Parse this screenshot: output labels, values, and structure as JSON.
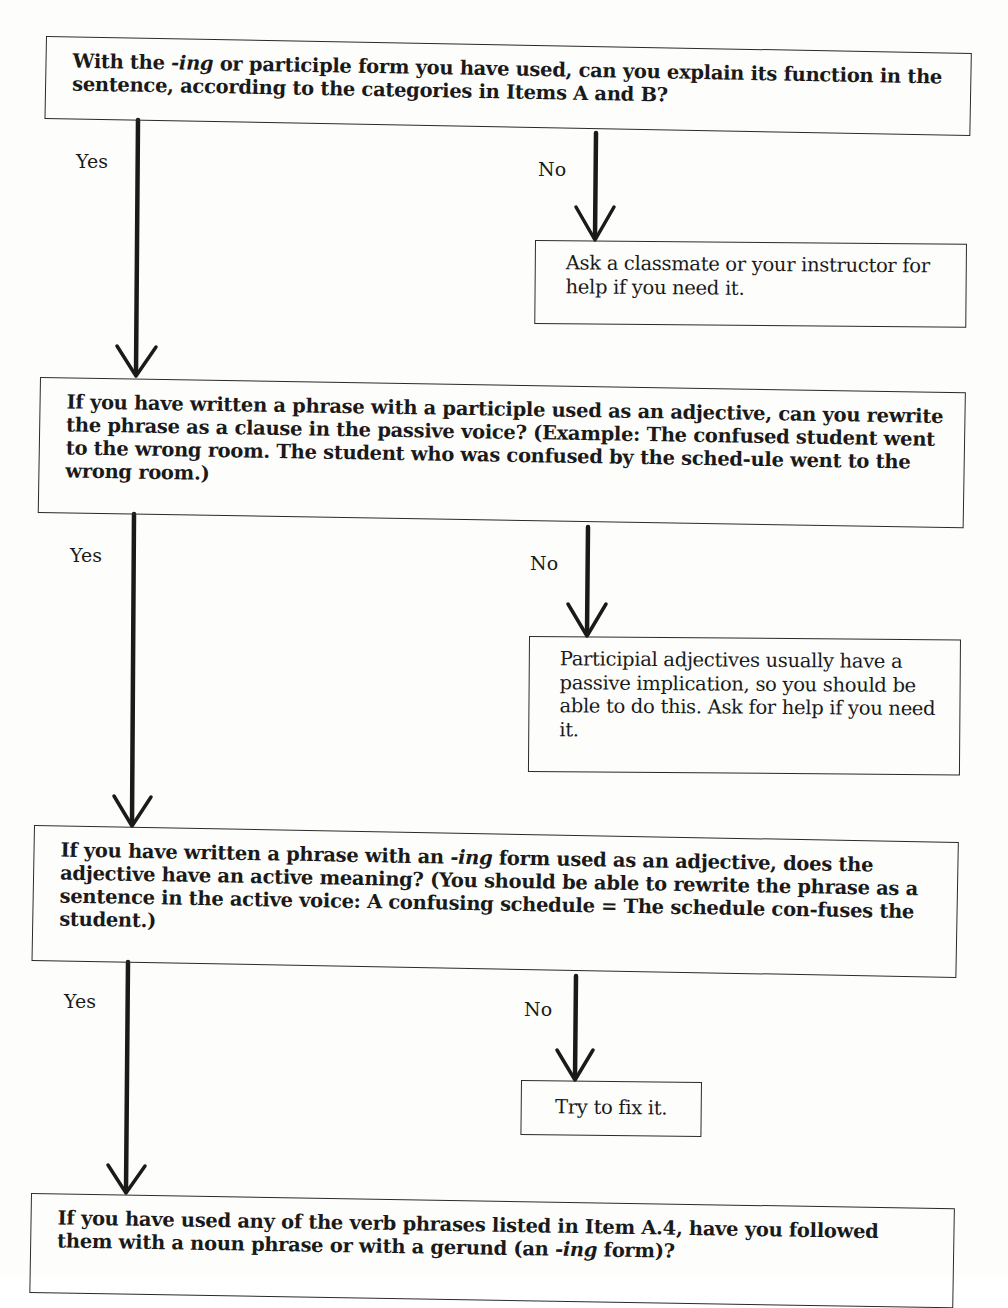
{
  "flowchart": {
    "questions": [
      {
        "id": "q1",
        "text_before": "With the ",
        "italic": "-ing",
        "text_after": " or participle form you have used, can you explain its function in the sentence, according to the categories in Items A and B?"
      },
      {
        "id": "q2",
        "text": "If you have written a phrase with a participle used as an adjective, can you rewrite the phrase as a clause in the passive voice? (Example: The confused student went to the wrong room. The student who was confused by the sched-ule went to the wrong room.)"
      },
      {
        "id": "q3",
        "text_before": "If you have written a phrase with an ",
        "italic": "-ing",
        "text_after": " form used as an adjective, does the adjective have an active meaning? (You should be able to rewrite the phrase as a sentence in the active voice: A confusing schedule = The schedule con-fuses the student.)"
      },
      {
        "id": "q4",
        "text_before": "If you have used any of the verb phrases listed in Item A.4, have you followed them with a noun phrase or with a gerund (an ",
        "italic": "-ing",
        "text_after": " form)?"
      }
    ],
    "answers": [
      {
        "id": "a1",
        "text": "Ask a classmate or your instructor for help if you need it."
      },
      {
        "id": "a2",
        "text": "Participial adjectives usually have a passive implication, so you should be able to do this. Ask for help if you need it."
      },
      {
        "id": "a3",
        "text": "Try to fix it."
      }
    ],
    "branch_labels": {
      "yes": "Yes",
      "no": "No"
    }
  }
}
